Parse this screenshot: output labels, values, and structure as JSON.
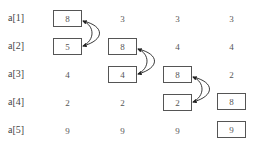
{
  "labels": [
    "a[1]",
    "a[2]",
    "a[3]",
    "a[4]",
    "a[5]"
  ],
  "columns": [
    {
      "values": [
        "8",
        "5",
        "4",
        "2",
        "9"
      ],
      "boxed": [
        0,
        1
      ]
    },
    {
      "values": [
        "3",
        "8",
        "4",
        "2",
        "9"
      ],
      "boxed": [
        1,
        2
      ]
    },
    {
      "values": [
        "3",
        "4",
        "8",
        "2",
        "9"
      ],
      "boxed": [
        2,
        3
      ]
    },
    {
      "values": [
        "3",
        "4",
        "2",
        "8",
        "9"
      ],
      "boxed": [
        3,
        4
      ]
    }
  ],
  "swap_arrows": [
    {
      "column": 0,
      "rows": [
        0,
        1
      ]
    },
    {
      "column": 1,
      "rows": [
        1,
        2
      ]
    },
    {
      "column": 2,
      "rows": [
        2,
        3
      ]
    }
  ]
}
